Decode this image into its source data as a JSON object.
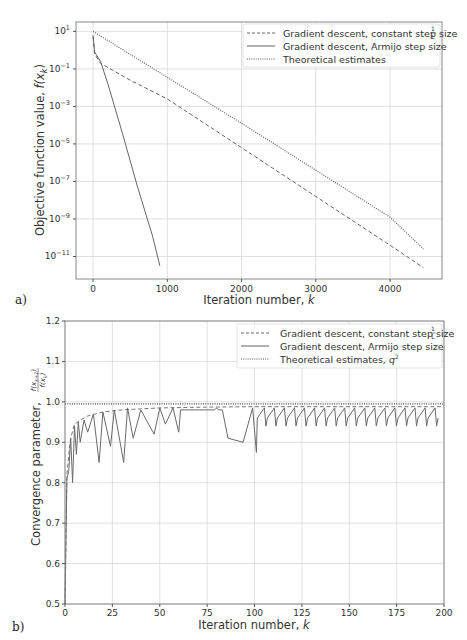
{
  "chart_data": [
    {
      "panel_label": "a)",
      "type": "line",
      "title": "",
      "xlabel": "Iteration number, k",
      "ylabel": "Objective function value, f(x_k)",
      "yscale": "log",
      "xlim": [
        -230,
        4700
      ],
      "ylim_log10": [
        -12.2,
        1.5
      ],
      "grid": true,
      "legend_position": "upper right",
      "xticks": [
        0,
        1000,
        2000,
        3000,
        4000
      ],
      "xtick_labels": [
        "0",
        "1000",
        "2000",
        "3000",
        "4000"
      ],
      "yticks_log10": [
        1,
        -1,
        -3,
        -5,
        -7,
        -9,
        -11
      ],
      "ytick_labels": [
        "10^1",
        "10^-1",
        "10^-3",
        "10^-5",
        "10^-7",
        "10^-9",
        "10^-11"
      ],
      "series": [
        {
          "name": "Gradient descent, constant step size 1/L",
          "style": "dashed",
          "x": [
            0,
            20,
            100,
            500,
            1000,
            2000,
            3000,
            4000,
            4450
          ],
          "log10_y": [
            0.7,
            -0.2,
            -0.7,
            -1.6,
            -2.6,
            -5.2,
            -7.8,
            -10.4,
            -11.6
          ]
        },
        {
          "name": "Gradient descent, Armijo step size",
          "style": "solid",
          "x": [
            0,
            20,
            100,
            200,
            400,
            600,
            800,
            900
          ],
          "log10_y": [
            0.8,
            -0.1,
            -0.6,
            -1.8,
            -4.5,
            -7.3,
            -9.9,
            -11.5
          ]
        },
        {
          "name": "Theoretical estimates",
          "style": "dotted",
          "x": [
            0,
            1000,
            2000,
            3000,
            4000,
            4450
          ],
          "log10_y": [
            1.0,
            -1.45,
            -3.9,
            -6.4,
            -8.9,
            -10.6
          ]
        }
      ]
    },
    {
      "panel_label": "b)",
      "type": "line",
      "title": "",
      "xlabel": "Iteration number, k",
      "ylabel": "Convergence parameter, f(x_{k+1})/f(x_k)",
      "xlim": [
        0,
        200
      ],
      "ylim": [
        0.5,
        1.2
      ],
      "grid": true,
      "legend_position": "upper right",
      "xticks": [
        0,
        25,
        50,
        75,
        100,
        125,
        150,
        175,
        200
      ],
      "xtick_labels": [
        "0",
        "25",
        "50",
        "75",
        "100",
        "125",
        "150",
        "175",
        "200"
      ],
      "yticks": [
        0.5,
        0.6,
        0.7,
        0.8,
        0.9,
        1.0,
        1.1,
        1.2
      ],
      "ytick_labels": [
        "0.5",
        "0.6",
        "0.7",
        "0.8",
        "0.9",
        "1.0",
        "1.1",
        "1.2"
      ],
      "series": [
        {
          "name": "Gradient descent, constant step size 1/L",
          "style": "dashed",
          "x": [
            0,
            1,
            2,
            3,
            5,
            8,
            12,
            20,
            30,
            50,
            75,
            100,
            150,
            200
          ],
          "y": [
            0.5,
            0.82,
            0.87,
            0.91,
            0.945,
            0.955,
            0.965,
            0.975,
            0.98,
            0.985,
            0.987,
            0.988,
            0.988,
            0.988
          ]
        },
        {
          "name": "Gradient descent, Armijo step size",
          "style": "solid",
          "description": "oscillating sawtooth below ~0.985 with periodic dips",
          "x": [
            0,
            1,
            2,
            3,
            4,
            5,
            6,
            7,
            8,
            10,
            12,
            15,
            18,
            20,
            24,
            26,
            31,
            33,
            36,
            40,
            47,
            50,
            53,
            57,
            60,
            80,
            86,
            94,
            99,
            101,
            110,
            200
          ],
          "y": [
            0.5,
            0.81,
            0.83,
            0.91,
            0.8,
            0.94,
            0.87,
            0.95,
            0.9,
            0.955,
            0.925,
            0.97,
            0.85,
            0.975,
            0.89,
            0.98,
            0.85,
            0.985,
            0.91,
            0.98,
            0.92,
            0.985,
            0.945,
            0.985,
            0.925,
            0.985,
            0.91,
            0.9,
            0.985,
            0.875,
            0.985,
            0.94
          ]
        },
        {
          "name": "Theoretical estimates, q^2",
          "style": "dotted",
          "x": [
            0,
            200
          ],
          "y": [
            0.995,
            0.995
          ]
        }
      ]
    }
  ],
  "panels": {
    "a": {
      "label": "a)",
      "xlabel": "Iteration number, ",
      "xlabel_var": "k",
      "ylabel": "Objective function value, ",
      "ylabel_var": "f(x",
      "ylabel_sub": "k",
      "legend": [
        {
          "text": "Gradient descent, constant step size ",
          "frac_num": "1",
          "frac_den": "L"
        },
        {
          "text": "Gradient descent, Armijo step size"
        },
        {
          "text": "Theoretical estimates"
        }
      ]
    },
    "b": {
      "label": "b)",
      "xlabel": "Iteration number, ",
      "xlabel_var": "k",
      "ylabel": "Convergence parameter, ",
      "ylabel_frac_num": "f(x_{k+1})",
      "ylabel_frac_den": "f(x_k)",
      "legend": [
        {
          "text": "Gradient descent, constant step size ",
          "frac_num": "1",
          "frac_den": "L"
        },
        {
          "text": "Gradient descent, Armijo step size"
        },
        {
          "text": "Theoretical estimates, ",
          "var": "q",
          "sup": "2"
        }
      ]
    }
  }
}
